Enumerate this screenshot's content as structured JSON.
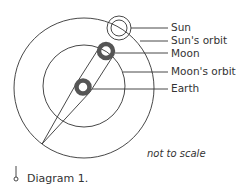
{
  "diagram": {
    "labels": {
      "sun": "Sun",
      "suns_orbit": "Sun's orbit",
      "moon": "Moon",
      "moons_orbit": "Moon's orbit",
      "earth": "Earth"
    },
    "note": "not to scale",
    "caption": "Diagram 1.",
    "colors": {
      "stroke": "#333333",
      "body_fill": "#555555"
    }
  }
}
